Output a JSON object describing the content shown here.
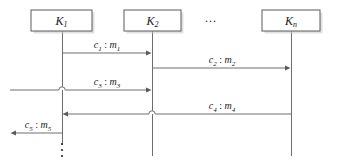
{
  "diagram": {
    "type": "sequence-diagram",
    "title": "",
    "colors": {
      "line": "#6e6e6e",
      "box_stroke": "#5a5a5a",
      "box_fill": "#ffffff",
      "shadow": "#c9c9c9",
      "text": "#1a1a1a",
      "background": "#ffffff"
    },
    "lifelines": [
      {
        "id": "k1",
        "base": "K",
        "sub": "1",
        "box": {
          "x": 31,
          "y": 10,
          "width": 61,
          "height": 21
        },
        "axis_x": 62,
        "line_top": 31,
        "line_bottom": 145
      },
      {
        "id": "k2",
        "base": "K",
        "sub": "2",
        "box": {
          "x": 124,
          "y": 10,
          "width": 57,
          "height": 21
        },
        "axis_x": 152,
        "line_top": 31,
        "line_bottom": 156
      },
      {
        "id": "kn",
        "base": "K",
        "sub": "n",
        "box": {
          "x": 262,
          "y": 10,
          "width": 58,
          "height": 21
        },
        "axis_x": 291,
        "line_top": 31,
        "line_bottom": 156
      }
    ],
    "horizontal_ellipsis": {
      "text": "...",
      "x": 211,
      "y": 22
    },
    "vertical_ellipsis": {
      "axis_x": 62,
      "dots": 3,
      "y_start": 144,
      "spacing": 6,
      "radius": 1.1
    },
    "messages": [
      {
        "id": "m1",
        "cipher": "c",
        "cipher_sub": "1",
        "separator": ":",
        "plain": "m",
        "plain_sub": "1",
        "from_x": 62,
        "to_x": 152,
        "y": 53,
        "direction": "right",
        "label_x": 107,
        "label_y": 48,
        "hops": []
      },
      {
        "id": "m2",
        "cipher": "c",
        "cipher_sub": "2",
        "separator": ":",
        "plain": "m",
        "plain_sub": "2",
        "from_x": 152,
        "to_x": 291,
        "y": 68,
        "direction": "right",
        "label_x": 222,
        "label_y": 63,
        "hops": []
      },
      {
        "id": "m3",
        "cipher": "c",
        "cipher_sub": "3",
        "separator": ":",
        "plain": "m",
        "plain_sub": "3",
        "from_x": 10,
        "to_x": 152,
        "y": 90,
        "direction": "right",
        "label_x": 107,
        "label_y": 85,
        "hops": [
          62
        ]
      },
      {
        "id": "m4",
        "cipher": "c",
        "cipher_sub": "4",
        "separator": ":",
        "plain": "m",
        "plain_sub": "4",
        "from_x": 291,
        "to_x": 62,
        "y": 114,
        "direction": "left",
        "label_x": 222,
        "label_y": 109,
        "hops": [
          152
        ]
      },
      {
        "id": "m5",
        "cipher": "c",
        "cipher_sub": "5",
        "separator": ":",
        "plain": "m",
        "plain_sub": "5",
        "from_x": 62,
        "to_x": 10,
        "y": 133,
        "direction": "left",
        "label_x": 38,
        "label_y": 128,
        "hops": []
      }
    ]
  }
}
